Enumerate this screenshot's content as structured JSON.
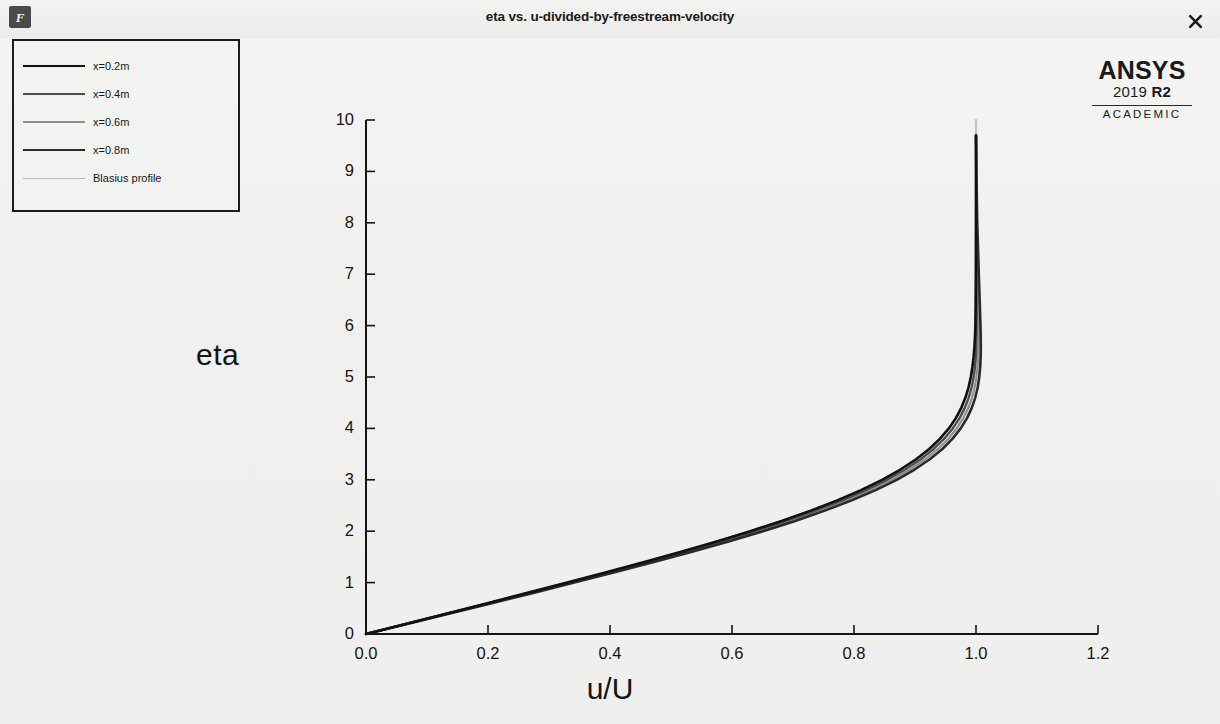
{
  "window": {
    "title": "eta vs. u-divided-by-freestream-velocity",
    "app_icon": "fluent-icon",
    "close_label": "×"
  },
  "branding": {
    "name": "ANSYS",
    "version_year": "2019",
    "version_release": "R2",
    "edition": "ACADEMIC"
  },
  "legend": {
    "items": [
      {
        "label": "x=0.2m",
        "color": "#111111",
        "width": 2.6
      },
      {
        "label": "x=0.4m",
        "color": "#4d4d4d",
        "width": 2.4
      },
      {
        "label": "x=0.6m",
        "color": "#8e8e8e",
        "width": 2.2
      },
      {
        "label": "x=0.8m",
        "color": "#2a2a2a",
        "width": 2.6
      },
      {
        "label": "Blasius profile",
        "color": "#b9b9b9",
        "width": 1.8
      }
    ]
  },
  "chart_data": {
    "type": "line",
    "title": "eta vs. u-divided-by-freestream-velocity",
    "xlabel": "u/U",
    "ylabel": "eta",
    "xlim": [
      0.0,
      1.2
    ],
    "ylim": [
      0,
      10
    ],
    "xticks": [
      0.0,
      0.2,
      0.4,
      0.6,
      0.8,
      1.0,
      1.2
    ],
    "xticklabels": [
      "0.0",
      "0.2",
      "0.4",
      "0.6",
      "0.8",
      "1.0",
      "1.2"
    ],
    "yticks": [
      0,
      1,
      2,
      3,
      4,
      5,
      6,
      7,
      8,
      9,
      10
    ],
    "yticklabels": [
      "0",
      "1",
      "2",
      "3",
      "4",
      "5",
      "6",
      "7",
      "8",
      "9",
      "10"
    ],
    "grid": false,
    "legend_position": "top-left-outside",
    "series": [
      {
        "name": "x=0.2m",
        "color": "#111111",
        "width": 2.6,
        "x": [
          0.0,
          0.0664,
          0.1328,
          0.1989,
          0.2647,
          0.3298,
          0.3938,
          0.4563,
          0.5168,
          0.5748,
          0.6298,
          0.6813,
          0.729,
          0.7725,
          0.8115,
          0.8461,
          0.8761,
          0.9018,
          0.9233,
          0.9411,
          0.9555,
          0.967,
          0.9759,
          0.9827,
          0.9878,
          0.9915,
          0.9942,
          0.9962,
          0.9975,
          0.9984,
          0.999,
          0.9994,
          0.9997,
          0.9999,
          1.0,
          1.0
        ],
        "y": [
          0.0,
          0.2,
          0.4,
          0.6,
          0.8,
          1.0,
          1.2,
          1.4,
          1.6,
          1.8,
          2.0,
          2.2,
          2.4,
          2.6,
          2.8,
          3.0,
          3.2,
          3.4,
          3.6,
          3.8,
          4.0,
          4.2,
          4.4,
          4.6,
          4.8,
          5.0,
          5.2,
          5.4,
          5.6,
          5.8,
          6.0,
          6.4,
          7.0,
          8.0,
          9.0,
          9.7
        ]
      },
      {
        "name": "x=0.4m",
        "color": "#4d4d4d",
        "width": 2.4,
        "x": [
          0.0,
          0.0672,
          0.1344,
          0.2013,
          0.2679,
          0.3337,
          0.3984,
          0.4616,
          0.5228,
          0.5814,
          0.6369,
          0.6888,
          0.7368,
          0.7805,
          0.8196,
          0.8541,
          0.884,
          0.9094,
          0.9306,
          0.948,
          0.962,
          0.9731,
          0.9817,
          0.9881,
          0.9928,
          0.9961,
          0.9984,
          0.9999,
          1.0006,
          1.0009,
          1.001,
          1.001,
          1.0008,
          1.0005,
          1.0002,
          1.0
        ],
        "y": [
          0.0,
          0.2,
          0.4,
          0.6,
          0.8,
          1.0,
          1.2,
          1.4,
          1.6,
          1.8,
          2.0,
          2.2,
          2.4,
          2.6,
          2.8,
          3.0,
          3.2,
          3.4,
          3.6,
          3.8,
          4.0,
          4.2,
          4.4,
          4.6,
          4.8,
          5.0,
          5.2,
          5.4,
          5.6,
          5.8,
          6.0,
          6.4,
          7.0,
          8.0,
          9.0,
          9.7
        ]
      },
      {
        "name": "x=0.6m",
        "color": "#8e8e8e",
        "width": 2.2,
        "x": [
          0.0,
          0.068,
          0.136,
          0.2037,
          0.2711,
          0.3376,
          0.403,
          0.4668,
          0.5287,
          0.588,
          0.644,
          0.6963,
          0.7446,
          0.7885,
          0.8277,
          0.8621,
          0.8918,
          0.9169,
          0.9378,
          0.9549,
          0.9685,
          0.9792,
          0.9874,
          0.9935,
          0.9978,
          1.0007,
          1.0026,
          1.0037,
          1.0042,
          1.0043,
          1.0042,
          1.0038,
          1.003,
          1.0015,
          1.0005,
          1.0
        ],
        "y": [
          0.0,
          0.2,
          0.4,
          0.6,
          0.8,
          1.0,
          1.2,
          1.4,
          1.6,
          1.8,
          2.0,
          2.2,
          2.4,
          2.6,
          2.8,
          3.0,
          3.2,
          3.4,
          3.6,
          3.8,
          4.0,
          4.2,
          4.4,
          4.6,
          4.8,
          5.0,
          5.2,
          5.4,
          5.6,
          5.8,
          6.0,
          6.4,
          7.0,
          8.0,
          9.0,
          9.7
        ]
      },
      {
        "name": "x=0.8m",
        "color": "#2a2a2a",
        "width": 2.6,
        "x": [
          0.0,
          0.0688,
          0.1376,
          0.2061,
          0.2743,
          0.3415,
          0.4076,
          0.472,
          0.5345,
          0.5944,
          0.6509,
          0.7036,
          0.7521,
          0.7962,
          0.8355,
          0.8699,
          0.8994,
          0.9243,
          0.9449,
          0.9616,
          0.9749,
          0.9853,
          0.9931,
          0.9988,
          1.0028,
          1.0054,
          1.0069,
          1.0077,
          1.0079,
          1.0077,
          1.0073,
          1.0063,
          1.0046,
          1.002,
          1.0006,
          1.0
        ],
        "y": [
          0.0,
          0.2,
          0.4,
          0.6,
          0.8,
          1.0,
          1.2,
          1.4,
          1.6,
          1.8,
          2.0,
          2.2,
          2.4,
          2.6,
          2.8,
          3.0,
          3.2,
          3.4,
          3.6,
          3.8,
          4.0,
          4.2,
          4.4,
          4.6,
          4.8,
          5.0,
          5.2,
          5.4,
          5.6,
          5.8,
          6.0,
          6.4,
          7.0,
          8.0,
          9.0,
          9.7
        ]
      },
      {
        "name": "Blasius profile",
        "color": "#b9b9b9",
        "width": 1.8,
        "x": [
          0.0,
          0.0664,
          0.1328,
          0.1989,
          0.2647,
          0.3298,
          0.3938,
          0.4563,
          0.5168,
          0.5748,
          0.6298,
          0.6813,
          0.729,
          0.7725,
          0.8115,
          0.8461,
          0.8761,
          0.9018,
          0.9233,
          0.9411,
          0.9555,
          0.967,
          0.9759,
          0.9827,
          0.9878,
          0.9915,
          0.9942,
          0.9962,
          0.9975,
          0.9984,
          0.999,
          0.9996,
          0.9999,
          1.0,
          1.0,
          1.0
        ],
        "y": [
          0.0,
          0.2,
          0.4,
          0.6,
          0.8,
          1.0,
          1.2,
          1.4,
          1.6,
          1.8,
          2.0,
          2.2,
          2.4,
          2.6,
          2.8,
          3.0,
          3.2,
          3.4,
          3.6,
          3.8,
          4.0,
          4.2,
          4.4,
          4.6,
          4.8,
          5.0,
          5.2,
          5.4,
          5.6,
          5.8,
          6.0,
          6.4,
          7.0,
          8.0,
          9.2,
          10.0
        ]
      }
    ]
  },
  "footnote": {
    "text": ""
  }
}
